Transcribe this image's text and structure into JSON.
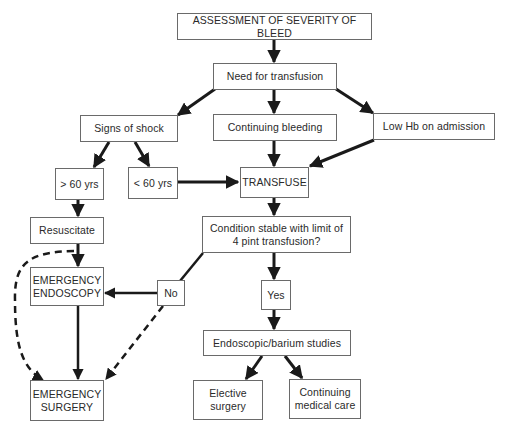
{
  "diagram": {
    "type": "flowchart",
    "title": "ASSESSMENT OF SEVERITY OF BLEED",
    "nodes": {
      "assessment": "ASSESSMENT OF SEVERITY OF BLEED",
      "need_transfusion": "Need for transfusion",
      "signs_shock": "Signs of shock",
      "continuing_bleeding": "Continuing bleeding",
      "low_hb": "Low Hb on admission",
      "over_60": "> 60 yrs",
      "under_60": "< 60 yrs",
      "transfuse": "TRANSFUSE",
      "resuscitate": "Resuscitate",
      "condition_stable": "Condition stable with limit of\n4 pint transfusion?",
      "emergency_endoscopy": "EMERGENCY\nENDOSCOPY",
      "no": "No",
      "yes": "Yes",
      "endoscopic_barium": "Endoscopic/barium studies",
      "emergency_surgery": "EMERGENCY\nSURGERY",
      "elective_surgery": "Elective\nsurgery",
      "continuing_medical_care": "Continuing\nmedical care"
    },
    "edges": [
      {
        "from": "assessment",
        "to": "need_transfusion",
        "style": "solid"
      },
      {
        "from": "need_transfusion",
        "to": "signs_shock",
        "style": "solid"
      },
      {
        "from": "need_transfusion",
        "to": "continuing_bleeding",
        "style": "solid"
      },
      {
        "from": "need_transfusion",
        "to": "low_hb",
        "style": "solid"
      },
      {
        "from": "signs_shock",
        "to": "over_60",
        "style": "solid"
      },
      {
        "from": "signs_shock",
        "to": "under_60",
        "style": "solid"
      },
      {
        "from": "under_60",
        "to": "transfuse",
        "style": "solid"
      },
      {
        "from": "continuing_bleeding",
        "to": "transfuse",
        "style": "solid"
      },
      {
        "from": "low_hb",
        "to": "transfuse",
        "style": "solid"
      },
      {
        "from": "over_60",
        "to": "resuscitate",
        "style": "solid"
      },
      {
        "from": "transfuse",
        "to": "condition_stable",
        "style": "solid"
      },
      {
        "from": "resuscitate",
        "to": "emergency_endoscopy",
        "style": "solid"
      },
      {
        "from": "resuscitate",
        "to": "emergency_surgery",
        "style": "dashed"
      },
      {
        "from": "condition_stable",
        "to": "no",
        "style": "solid"
      },
      {
        "from": "no",
        "to": "emergency_endoscopy",
        "style": "solid"
      },
      {
        "from": "no",
        "to": "emergency_surgery",
        "style": "dashed"
      },
      {
        "from": "emergency_endoscopy",
        "to": "emergency_surgery",
        "style": "solid"
      },
      {
        "from": "condition_stable",
        "to": "yes",
        "style": "solid"
      },
      {
        "from": "yes",
        "to": "endoscopic_barium",
        "style": "solid"
      },
      {
        "from": "endoscopic_barium",
        "to": "elective_surgery",
        "style": "solid"
      },
      {
        "from": "endoscopic_barium",
        "to": "continuing_medical_care",
        "style": "solid"
      }
    ]
  },
  "colors": {
    "line": "#1a1a1a",
    "box_border": "#6a6a6a",
    "text": "#2a2a2a",
    "background": "#ffffff"
  }
}
